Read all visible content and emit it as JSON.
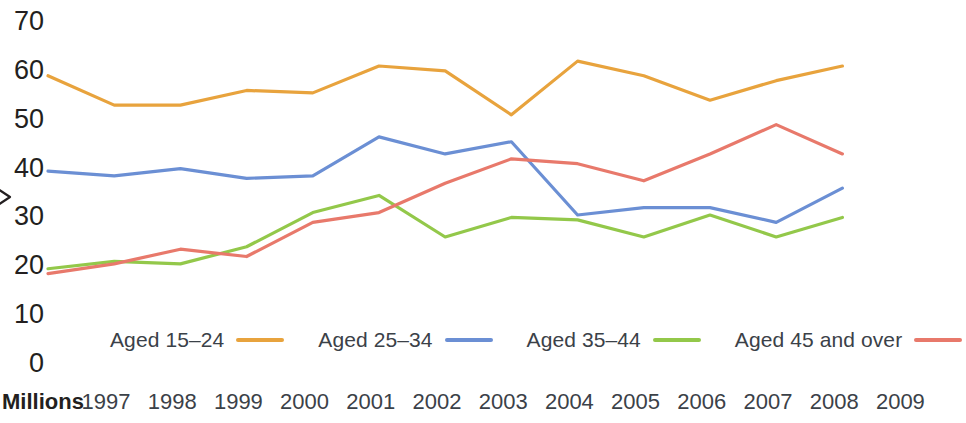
{
  "chart_data": {
    "type": "line",
    "title": "",
    "xlabel": "Millions",
    "ylabel": "",
    "categories": [
      "1997",
      "1998",
      "1999",
      "2000",
      "2001",
      "2002",
      "2003",
      "2004",
      "2005",
      "2006",
      "2007",
      "2008",
      "2009"
    ],
    "ylim": [
      0,
      70
    ],
    "yticks": [
      0,
      10,
      20,
      30,
      40,
      50,
      60,
      70
    ],
    "grid": false,
    "legend_position": "bottom",
    "series": [
      {
        "name": "Aged 15-24",
        "color": "#E8A33D",
        "values": [
          59,
          53,
          53,
          56,
          55.5,
          61,
          60,
          51,
          62,
          59,
          54,
          58,
          61
        ]
      },
      {
        "name": "Aged 25-34",
        "color": "#6B8FD4",
        "values": [
          39.5,
          38.5,
          40,
          38,
          38.5,
          46.5,
          43,
          45.5,
          30.5,
          32,
          32,
          29,
          36
        ]
      },
      {
        "name": "Aged 35-44",
        "color": "#93C84A",
        "values": [
          19.5,
          21,
          20.5,
          24,
          31,
          34.5,
          26,
          30,
          29.5,
          26,
          30.5,
          26,
          30
        ]
      },
      {
        "name": "Aged 45 and over",
        "color": "#E8796B",
        "values": [
          18.5,
          20.5,
          23.5,
          22,
          29,
          31,
          37,
          42,
          41,
          37.5,
          43,
          49,
          43
        ]
      }
    ]
  },
  "y_axis": {
    "ticks": [
      "70",
      "60",
      "50",
      "40",
      "30",
      "20",
      "10",
      "0"
    ]
  },
  "x_axis": {
    "unit_label": "Millions",
    "ticks": [
      "1997",
      "1998",
      "1999",
      "2000",
      "2001",
      "2002",
      "2003",
      "2004",
      "2005",
      "2006",
      "2007",
      "2008",
      "2009"
    ]
  },
  "legend": {
    "items": [
      {
        "label": "Aged 15–24",
        "color": "#E8A33D"
      },
      {
        "label": "Aged 25–34",
        "color": "#6B8FD4"
      },
      {
        "label": "Aged 35–44",
        "color": "#93C84A"
      },
      {
        "label": "Aged 45 and over",
        "color": "#E8796B"
      }
    ]
  }
}
